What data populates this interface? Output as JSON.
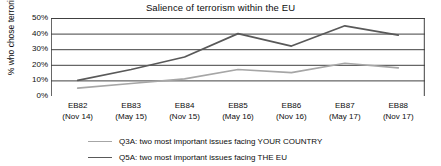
{
  "chart_data": {
    "type": "line",
    "title": "Salience of terrorism within the EU",
    "xlabel": "",
    "ylabel": "% who chose terrorism",
    "ylim": [
      0,
      50
    ],
    "yticks": [
      0,
      10,
      20,
      30,
      40,
      50
    ],
    "ytick_labels": [
      "0%",
      "10%",
      "20%",
      "30%",
      "40%",
      "50%"
    ],
    "grid": true,
    "legend_position": "bottom",
    "categories": [
      "EB82",
      "EB83",
      "EB84",
      "EB85",
      "EB86",
      "EB87",
      "EB88"
    ],
    "category_dates": [
      "(Nov 14)",
      "(May 15)",
      "(Nov 15)",
      "(May 16)",
      "(Nov 16)",
      "(May 17)",
      "(Nov 17)"
    ],
    "series": [
      {
        "name": "Q3A: two most important issues facing YOUR COUNTRY",
        "color": "#a6a6a6",
        "values": [
          5,
          8,
          11,
          17,
          15,
          21,
          18
        ]
      },
      {
        "name": "Q5A: two most important issues facing THE EU",
        "color": "#595959",
        "values": [
          10,
          17,
          25,
          40,
          32,
          45,
          39
        ]
      }
    ]
  },
  "axis": {
    "y_title": "% who chose terrorism"
  },
  "colors": {
    "gridline": "#404040",
    "axis_text": "#0d0d0d",
    "series_light": "#a6a6a6",
    "series_dark": "#595959",
    "background": "#ffffff"
  }
}
